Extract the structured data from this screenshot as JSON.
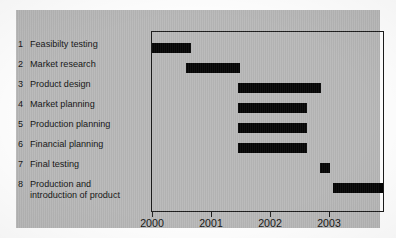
{
  "chart_data": {
    "type": "bar",
    "subtype": "gantt",
    "title": "",
    "xlabel": "",
    "ylabel": "",
    "xlim": [
      2000,
      2003.95
    ],
    "grid": false,
    "legend": null,
    "x_ticks": [
      {
        "value": 2000,
        "label": "2000"
      },
      {
        "value": 2001,
        "label": "2001"
      },
      {
        "value": 2002,
        "label": "2002"
      },
      {
        "value": 2003,
        "label": "2003"
      }
    ],
    "categories": [
      "Feasibilty testing",
      "Market research",
      "Product design",
      "Market planning",
      "Production planning",
      "Financial planning",
      "Final testing",
      "Production and introduction of product"
    ],
    "tasks": [
      {
        "number": "1",
        "label": "Feasibilty testing",
        "start": 2000.0,
        "end": 2000.66
      },
      {
        "number": "2",
        "label": "Market research",
        "start": 2000.58,
        "end": 2001.5
      },
      {
        "number": "3",
        "label": "Product design",
        "start": 2001.45,
        "end": 2002.87
      },
      {
        "number": "4",
        "label": "Market planning",
        "start": 2001.45,
        "end": 2002.62
      },
      {
        "number": "5",
        "label": "Production planning",
        "start": 2001.45,
        "end": 2002.62
      },
      {
        "number": "6",
        "label": "Financial planning",
        "start": 2001.45,
        "end": 2002.62
      },
      {
        "number": "7",
        "label": "Final testing",
        "start": 2002.84,
        "end": 2003.02
      },
      {
        "number": "8",
        "label": "Production and introduction of product",
        "start": 2003.06,
        "end": 2003.95
      }
    ],
    "colors": {
      "bar": "#050505",
      "panel_background": "#b8b8b8",
      "page_background": "#fdfdfd",
      "axis": "#1b1b1b",
      "text": "#131313"
    }
  }
}
